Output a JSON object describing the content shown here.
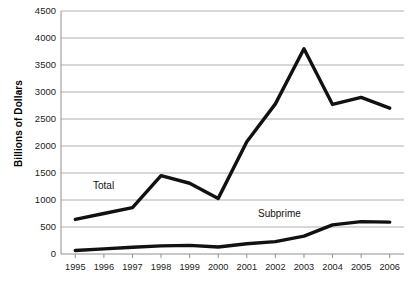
{
  "chart_data": {
    "type": "line",
    "title": "",
    "subtitle": "",
    "xlabel": "",
    "ylabel": "Billions of Dollars",
    "x": [
      1995,
      1996,
      1997,
      1998,
      1999,
      2000,
      2001,
      2002,
      2003,
      2004,
      2005,
      2006
    ],
    "categories": [
      "1995",
      "1996",
      "1997",
      "1998",
      "1999",
      "2000",
      "2001",
      "2002",
      "2003",
      "2004",
      "2005",
      "2006"
    ],
    "series": [
      {
        "name": "Total",
        "values": [
          640,
          750,
          860,
          1450,
          1310,
          1030,
          2080,
          2780,
          3800,
          2770,
          2900,
          2700
        ],
        "color": "#111111"
      },
      {
        "name": "Subprime",
        "values": [
          65,
          95,
          125,
          150,
          160,
          130,
          190,
          230,
          330,
          540,
          600,
          590
        ],
        "color": "#111111"
      }
    ],
    "ylim": [
      0,
      4500
    ],
    "yticks": [
      "0",
      "500",
      "1000",
      "1500",
      "2000",
      "2500",
      "3000",
      "3500",
      "4000",
      "4500"
    ],
    "ytick_values": [
      0,
      500,
      1000,
      1500,
      2000,
      2500,
      3000,
      3500,
      4000,
      4500
    ],
    "grid": true,
    "grid_color": "#b0b0b0",
    "legend": "inline-annotations",
    "annotations": [
      {
        "text": "Total",
        "x": 1996.6,
        "y": 1700
      },
      {
        "text": "Subprime",
        "x": 2002.1,
        "y": 860
      }
    ],
    "background": "#ffffff"
  }
}
